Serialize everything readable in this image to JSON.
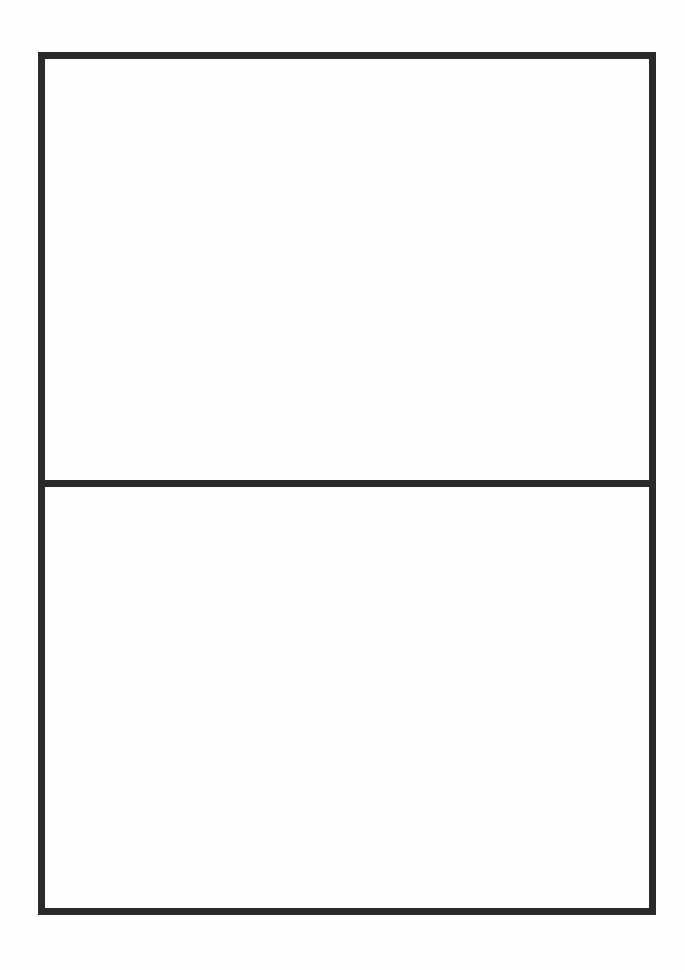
{
  "document": {
    "type": "blank-form",
    "frame": {
      "border_color": "#2a2a2a",
      "background": "#fefefe",
      "panels": [
        {
          "position": "top",
          "content": ""
        },
        {
          "position": "bottom",
          "content": ""
        }
      ]
    }
  }
}
